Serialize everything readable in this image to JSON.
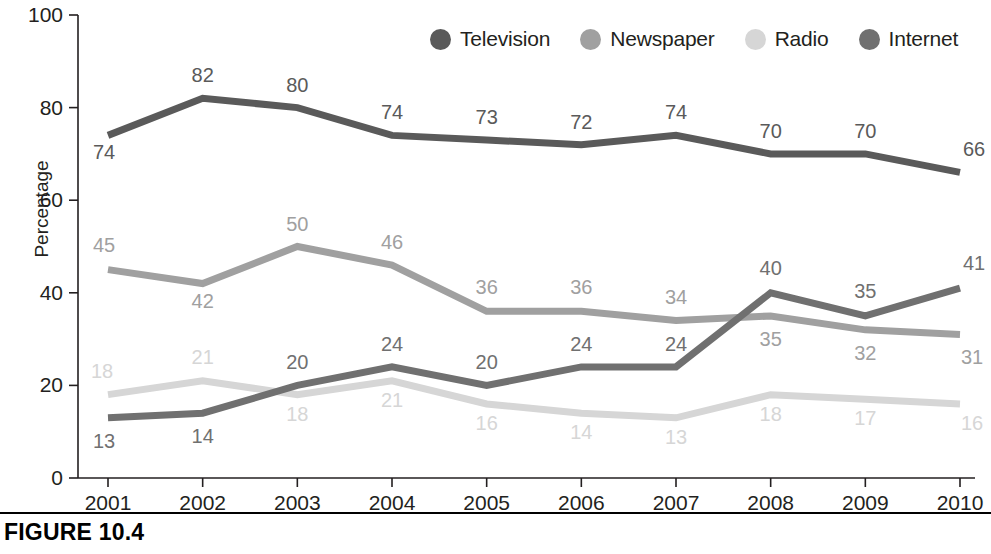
{
  "figure": {
    "caption": "FIGURE 10.4"
  },
  "legend": {
    "position": "top-right",
    "items": [
      {
        "label": "Television",
        "color": "#5a5a5a",
        "icon": "circle-marker-icon"
      },
      {
        "label": "Newspaper",
        "color": "#a0a0a0",
        "icon": "circle-marker-icon"
      },
      {
        "label": "Radio",
        "color": "#d6d6d6",
        "icon": "circle-marker-icon"
      },
      {
        "label": "Internet",
        "color": "#707070",
        "icon": "circle-marker-icon"
      }
    ]
  },
  "axes": {
    "y_title": "Percentage",
    "y_ticks": [
      "0",
      "20",
      "40",
      "60",
      "80",
      "100"
    ],
    "x_ticks": [
      "2001",
      "2002",
      "2003",
      "2004",
      "2005",
      "2006",
      "2007",
      "2008",
      "2009",
      "2010"
    ]
  },
  "chart_data": {
    "type": "line",
    "title": "FIGURE 10.4",
    "xlabel": "",
    "ylabel": "Percentage",
    "ylim": [
      0,
      100
    ],
    "grid": false,
    "legend_position": "top-right",
    "x": [
      "2001",
      "2002",
      "2003",
      "2004",
      "2005",
      "2006",
      "2007",
      "2008",
      "2009",
      "2010"
    ],
    "categories": [
      "2001",
      "2002",
      "2003",
      "2004",
      "2005",
      "2006",
      "2007",
      "2008",
      "2009",
      "2010"
    ],
    "series": [
      {
        "name": "Television",
        "color": "#5a5a5a",
        "values": [
          74,
          82,
          80,
          74,
          73,
          72,
          74,
          70,
          70,
          66
        ],
        "labels": [
          "74",
          "82",
          "80",
          "74",
          "73",
          "72",
          "74",
          "70",
          "70",
          "66"
        ]
      },
      {
        "name": "Newspaper",
        "color": "#a0a0a0",
        "values": [
          45,
          42,
          50,
          46,
          36,
          36,
          34,
          35,
          32,
          31
        ],
        "labels": [
          "45",
          "42",
          "50",
          "46",
          "36",
          "36",
          "34",
          "35",
          "32",
          "31"
        ]
      },
      {
        "name": "Radio",
        "color": "#d6d6d6",
        "values": [
          18,
          21,
          18,
          21,
          16,
          14,
          13,
          18,
          17,
          16
        ],
        "labels": [
          "18",
          "21",
          "18",
          "21",
          "16",
          "14",
          "13",
          "18",
          "17",
          "16"
        ]
      },
      {
        "name": "Internet",
        "color": "#707070",
        "values": [
          13,
          14,
          20,
          24,
          20,
          24,
          24,
          40,
          35,
          41
        ],
        "labels": [
          "13",
          "14",
          "20",
          "24",
          "20",
          "24",
          "24",
          "40",
          "35",
          "41"
        ]
      }
    ]
  }
}
